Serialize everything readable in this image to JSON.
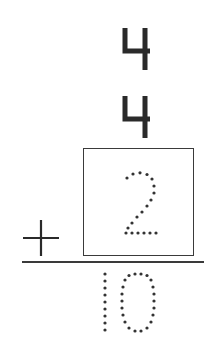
{
  "worksheet": {
    "type": "vertical-addition",
    "addends": [
      "4",
      "4",
      "2"
    ],
    "operator": "+",
    "sum": "10",
    "answer_box_value": "2",
    "answer_style": "dotted-trace",
    "colors": {
      "ink": "#2a2a2a",
      "dots": "#333333",
      "box_border": "#3a3a3a",
      "background": "#ffffff"
    }
  }
}
